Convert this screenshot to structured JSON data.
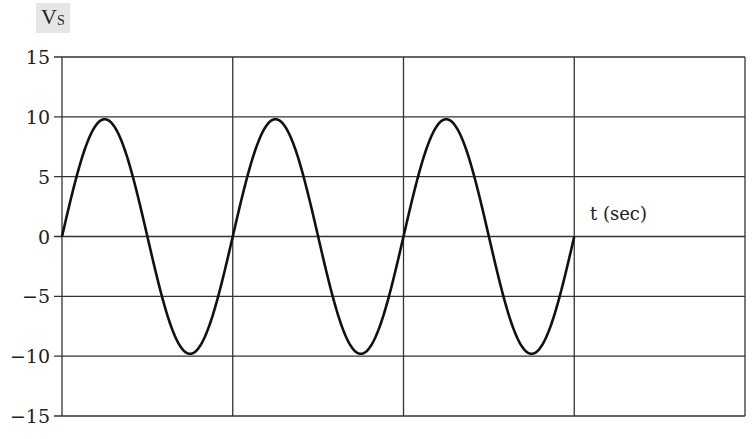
{
  "chart_data": {
    "type": "line",
    "title": "Vs",
    "title_main": "V",
    "title_sub": "S",
    "xlabel": "t (sec)",
    "ylabel": "Vs",
    "ylim": [
      -15,
      15
    ],
    "yticks": [
      15,
      10,
      5,
      0,
      -5,
      -10,
      -15
    ],
    "ytick_labels": [
      "15",
      "10",
      "5",
      "0",
      "−5",
      "−10",
      "−15"
    ],
    "xlim": [
      0,
      4
    ],
    "x_grid_divisions": 4,
    "xticks_labeled": false,
    "grid": true,
    "series": [
      {
        "name": "Vs",
        "function": "sine",
        "amplitude": 9.8,
        "cycles": 3,
        "x_start": 0,
        "x_end": 3,
        "period_grid_units": 1,
        "color": "#111111"
      }
    ]
  }
}
